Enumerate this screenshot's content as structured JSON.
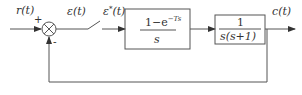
{
  "diagram": {
    "type": "sampled-data control system block diagram",
    "signals": {
      "input": "r(t)",
      "error": "ε(t)",
      "sampled_error": "ε*(t)",
      "output": "c(t)"
    },
    "summing_junction": {
      "plus_sign": "+",
      "minus_sign": "-"
    },
    "blocks": [
      {
        "name": "zero-order-hold",
        "numerator_main": "1−e",
        "numerator_sup": "−Ts",
        "denominator": "s"
      },
      {
        "name": "plant",
        "numerator": "1",
        "denominator": "s(s+1)"
      }
    ],
    "colors": {
      "line": "#555555",
      "text": "#333333",
      "background": "#ffffff"
    }
  }
}
